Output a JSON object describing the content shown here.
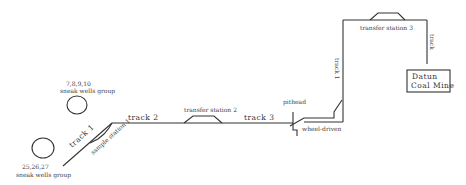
{
  "diagram": {
    "labels": {
      "wells_group_top_ids": "7,8,9,10",
      "wells_group_top_name": "sneak wells group",
      "wells_group_bottom_ids": "25,26,27",
      "wells_group_bottom_name": "sneak wells group",
      "track1": "track 1",
      "sample_station": "sample station 1",
      "track2": "track 2",
      "transfer_station2": "transfer station 2",
      "track3": "track 3",
      "pithead": "pithead",
      "wheel_driven": "wheel-driven",
      "track_right_vertical": "track 1",
      "transfer_station3": "transfer station 3",
      "track4": "track",
      "coal_mine_line1": "Datun",
      "coal_mine_line2": "Coal Mine"
    }
  }
}
